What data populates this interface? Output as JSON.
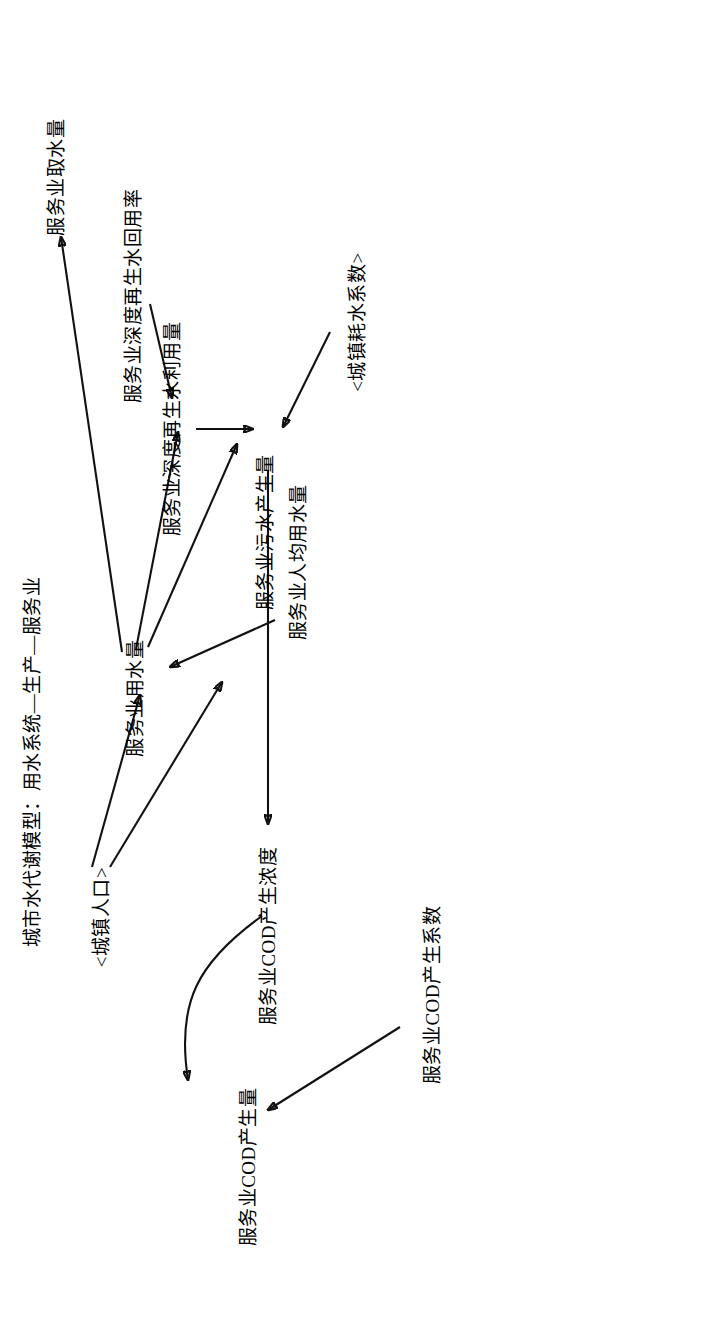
{
  "figure": {
    "title": "城市水代谢模型：用水系统—生产—服务业",
    "background_color": "#ffffff",
    "line_color": "#111111",
    "text_color": "#000000",
    "orientation": "rotated-90-ccw",
    "type": "causal-stock-flow-diagram"
  },
  "nodes": [
    {
      "id": "urban-population",
      "label": "<城镇人口>",
      "kind": "shadow-variable"
    },
    {
      "id": "service-cod-generation",
      "label": "服务业COD产生量",
      "kind": "variable"
    },
    {
      "id": "service-water-use",
      "label": "服务业用水量",
      "kind": "variable"
    },
    {
      "id": "service-water-withdrawal",
      "label": "服务业取水量",
      "kind": "variable"
    },
    {
      "id": "service-per-capita-water",
      "label": "服务业人均用水量",
      "kind": "variable"
    },
    {
      "id": "service-reclaimed-use",
      "label": "服务业深度再生水利用量",
      "kind": "variable"
    },
    {
      "id": "service-reclaimed-rate",
      "label": "服务业深度再生水回用率",
      "kind": "variable"
    },
    {
      "id": "service-wastewater",
      "label": "服务业污水产生量",
      "kind": "variable"
    },
    {
      "id": "urban-consumption-coef",
      "label": "<城镇耗水系数>",
      "kind": "shadow-variable"
    },
    {
      "id": "service-cod-conc",
      "label": "服务业COD产生浓度",
      "kind": "variable"
    },
    {
      "id": "service-cod-coef",
      "label": "服务业COD产生系数",
      "kind": "variable"
    }
  ],
  "edges": [
    {
      "from": "urban-population",
      "to": "service-water-use"
    },
    {
      "from": "urban-population",
      "to": "service-cod-generation"
    },
    {
      "from": "service-per-capita-water",
      "to": "service-water-use"
    },
    {
      "from": "service-water-use",
      "to": "service-water-withdrawal"
    },
    {
      "from": "service-water-use",
      "to": "service-reclaimed-use"
    },
    {
      "from": "service-water-use",
      "to": "service-wastewater"
    },
    {
      "from": "service-reclaimed-rate",
      "to": "service-reclaimed-use"
    },
    {
      "from": "service-reclaimed-use",
      "to": "service-wastewater"
    },
    {
      "from": "urban-consumption-coef",
      "to": "service-wastewater"
    },
    {
      "from": "service-wastewater",
      "to": "service-cod-conc"
    },
    {
      "from": "service-cod-conc",
      "to": "service-cod-generation"
    },
    {
      "from": "service-cod-coef",
      "to": "service-cod-generation"
    }
  ]
}
